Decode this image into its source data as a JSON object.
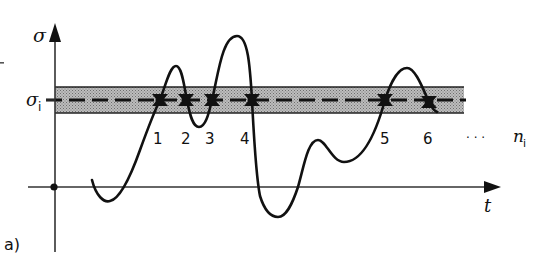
{
  "figure": {
    "panel_label": "a)",
    "y_axis": {
      "label": "σ"
    },
    "x_axis": {
      "label": "t"
    },
    "threshold": {
      "label": "σ",
      "subscript": "i",
      "band_color": "#a9a9a9",
      "line_style": "dashed"
    },
    "crossings": {
      "labels": [
        "1",
        "2",
        "3",
        "4",
        "5",
        "6"
      ],
      "ellipsis": "· · ·",
      "count_label": "n",
      "count_subscript": "i"
    },
    "colors": {
      "ink": "#111111",
      "band": "#a9a9a9",
      "background": "#ffffff"
    }
  }
}
